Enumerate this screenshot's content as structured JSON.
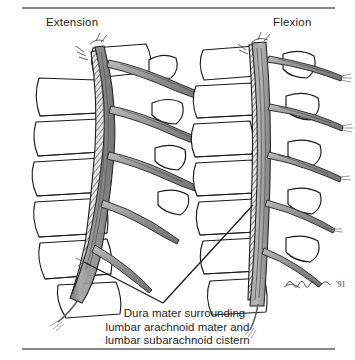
{
  "figure": {
    "background_color": "#ffffff",
    "rule_color": "#8a8a8a",
    "ink_color": "#1a1a1a"
  },
  "views": [
    {
      "id": "extension",
      "label": "Extension"
    },
    {
      "id": "flexion",
      "label": "Flexion"
    }
  ],
  "caption": {
    "line1": "Dura mater surrounding",
    "line2": "lumbar arachnoid mater and",
    "line3": "lumbar subarachnoid cistern"
  },
  "signature": {
    "text": "'91",
    "name": "artist-signature"
  },
  "anatomy": {
    "structures": [
      {
        "name": "vertebral-body",
        "fill": "#ffffff",
        "stroke": "#1a1a1a"
      },
      {
        "name": "dura-mater-hatched",
        "fill": "#b9b9b9",
        "stroke": "#1a1a1a"
      },
      {
        "name": "subarachnoid-cistern",
        "fill": "#9d9d9d",
        "stroke": "#1a1a1a"
      },
      {
        "name": "spinal-nerve-root",
        "fill": "#a8a8a8",
        "stroke": "#2a2a2a"
      },
      {
        "name": "cauda-equina",
        "fill": "#8e8e8e",
        "stroke": "#2a2a2a"
      },
      {
        "name": "intervertebral-disc",
        "fill": "#ffffff",
        "stroke": "#1a1a1a"
      }
    ],
    "leader_lines": {
      "name": "caption-leader-lines",
      "vertex_x": 163,
      "vertex_y": 303,
      "left_target_x": 84,
      "left_target_y": 262,
      "right_target_x": 253,
      "right_target_y": 205
    }
  }
}
